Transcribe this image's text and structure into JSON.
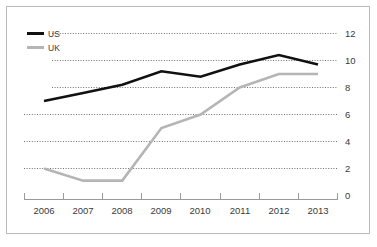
{
  "chart_data": {
    "type": "line",
    "title": "",
    "subtitle": "",
    "xlabel": "",
    "ylabel": "",
    "categories": [
      "2006",
      "2007",
      "2008",
      "2009",
      "2010",
      "2011",
      "2012",
      "2013"
    ],
    "series": [
      {
        "name": "US",
        "color": "#111111",
        "values": [
          7.0,
          7.6,
          8.2,
          9.2,
          8.8,
          9.7,
          10.4,
          9.7
        ]
      },
      {
        "name": "UK",
        "color": "#b5b5b5",
        "values": [
          2.0,
          1.1,
          1.1,
          5.0,
          6.0,
          8.0,
          9.0,
          9.0
        ]
      }
    ],
    "ylim": [
      0,
      12
    ],
    "yticks": [
      "0",
      "2",
      "4",
      "6",
      "8",
      "10",
      "12"
    ],
    "xticks": [
      "2006",
      "2007",
      "2008",
      "2009",
      "2010",
      "2011",
      "2012",
      "2013"
    ],
    "grid": true,
    "grid_axis": "y",
    "legend_position": "top-left",
    "legend": [
      {
        "label": "US",
        "color": "#111111"
      },
      {
        "label": "UK",
        "color": "#b5b5b5"
      }
    ],
    "annotations": []
  },
  "frame": {
    "border_color": "#b9b9b9",
    "background": "#ffffff"
  }
}
